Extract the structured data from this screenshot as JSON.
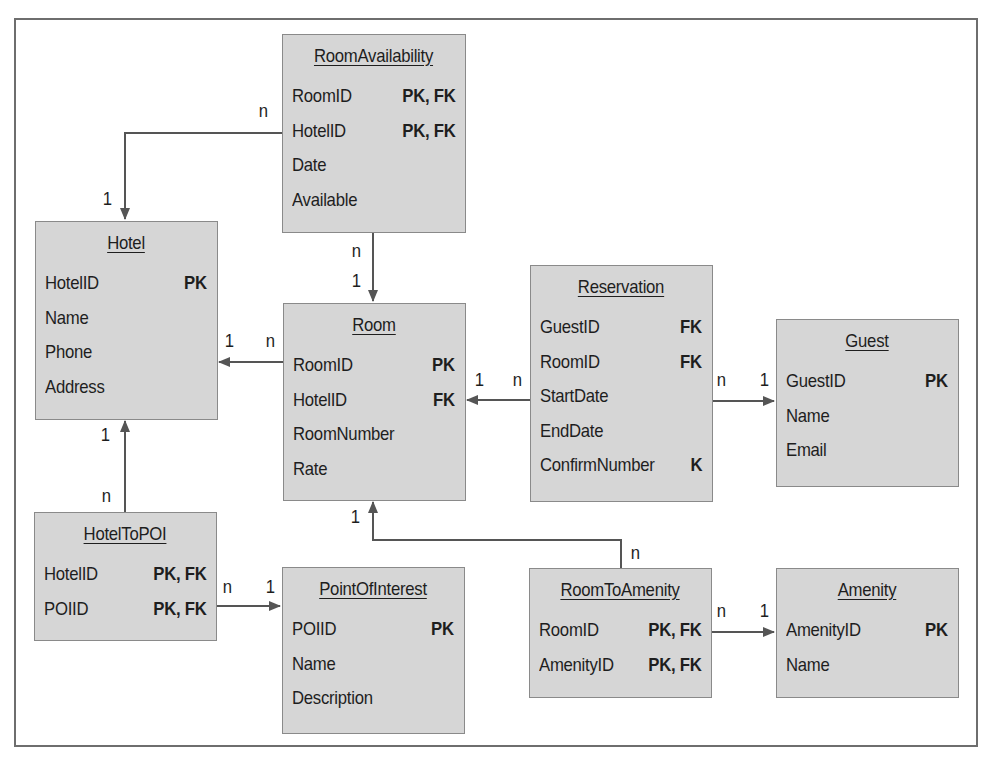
{
  "diagram": {
    "type": "entity-relationship",
    "entities": [
      {
        "id": "RoomAvailability",
        "title": "RoomAvailability",
        "attributes": [
          {
            "name": "RoomID",
            "key": "PK, FK"
          },
          {
            "name": "HotelID",
            "key": "PK, FK"
          },
          {
            "name": "Date",
            "key": ""
          },
          {
            "name": "Available",
            "key": ""
          }
        ]
      },
      {
        "id": "Hotel",
        "title": "Hotel",
        "attributes": [
          {
            "name": "HotelID",
            "key": "PK"
          },
          {
            "name": "Name",
            "key": ""
          },
          {
            "name": "Phone",
            "key": ""
          },
          {
            "name": "Address",
            "key": ""
          }
        ]
      },
      {
        "id": "Room",
        "title": "Room",
        "attributes": [
          {
            "name": "RoomID",
            "key": "PK"
          },
          {
            "name": "HotelID",
            "key": "FK"
          },
          {
            "name": "RoomNumber",
            "key": ""
          },
          {
            "name": "Rate",
            "key": ""
          }
        ]
      },
      {
        "id": "Reservation",
        "title": "Reservation",
        "attributes": [
          {
            "name": "GuestID",
            "key": "FK"
          },
          {
            "name": "RoomID",
            "key": "FK"
          },
          {
            "name": "StartDate",
            "key": ""
          },
          {
            "name": "EndDate",
            "key": ""
          },
          {
            "name": "ConfirmNumber",
            "key": "K"
          }
        ]
      },
      {
        "id": "Guest",
        "title": "Guest",
        "attributes": [
          {
            "name": "GuestID",
            "key": "PK"
          },
          {
            "name": "Name",
            "key": ""
          },
          {
            "name": "Email",
            "key": ""
          }
        ]
      },
      {
        "id": "HotelToPOI",
        "title": "HotelToPOI",
        "attributes": [
          {
            "name": "HotelID",
            "key": "PK, FK"
          },
          {
            "name": "POIID",
            "key": "PK, FK"
          }
        ]
      },
      {
        "id": "PointOfInterest",
        "title": "PointOfInterest",
        "attributes": [
          {
            "name": "POIID",
            "key": "PK"
          },
          {
            "name": "Name",
            "key": ""
          },
          {
            "name": "Description",
            "key": ""
          }
        ]
      },
      {
        "id": "RoomToAmenity",
        "title": "RoomToAmenity",
        "attributes": [
          {
            "name": "RoomID",
            "key": "PK, FK"
          },
          {
            "name": "AmenityID",
            "key": "PK, FK"
          }
        ]
      },
      {
        "id": "Amenity",
        "title": "Amenity",
        "attributes": [
          {
            "name": "AmenityID",
            "key": "PK"
          },
          {
            "name": "Name",
            "key": ""
          }
        ]
      }
    ],
    "relationships": [
      {
        "from": "RoomAvailability",
        "to": "Hotel",
        "from_card": "n",
        "to_card": "1"
      },
      {
        "from": "RoomAvailability",
        "to": "Room",
        "from_card": "n",
        "to_card": "1"
      },
      {
        "from": "Room",
        "to": "Hotel",
        "from_card": "n",
        "to_card": "1"
      },
      {
        "from": "Reservation",
        "to": "Room",
        "from_card": "n",
        "to_card": "1"
      },
      {
        "from": "Reservation",
        "to": "Guest",
        "from_card": "n",
        "to_card": "1"
      },
      {
        "from": "HotelToPOI",
        "to": "Hotel",
        "from_card": "n",
        "to_card": "1"
      },
      {
        "from": "HotelToPOI",
        "to": "PointOfInterest",
        "from_card": "n",
        "to_card": "1"
      },
      {
        "from": "RoomToAmenity",
        "to": "Room",
        "from_card": "n",
        "to_card": "1"
      },
      {
        "from": "RoomToAmenity",
        "to": "Amenity",
        "from_card": "n",
        "to_card": "1"
      }
    ],
    "cardinality_labels": {
      "ra_hotel_n": "n",
      "ra_hotel_1": "1",
      "ra_room_n": "n",
      "ra_room_1": "1",
      "room_hotel_1": "1",
      "room_hotel_n": "n",
      "res_room_1": "1",
      "res_room_n": "n",
      "res_guest_n": "n",
      "res_guest_1": "1",
      "htp_hotel_1": "1",
      "htp_hotel_n": "n",
      "htp_poi_n": "n",
      "htp_poi_1": "1",
      "rta_room_1": "1",
      "rta_room_n": "n",
      "rta_amenity_n": "n",
      "rta_amenity_1": "1"
    },
    "colors": {
      "entity_fill": "#d6d6d6",
      "entity_border": "#8a8a8a",
      "line": "#555555",
      "frame": "#6e6e6e"
    }
  }
}
